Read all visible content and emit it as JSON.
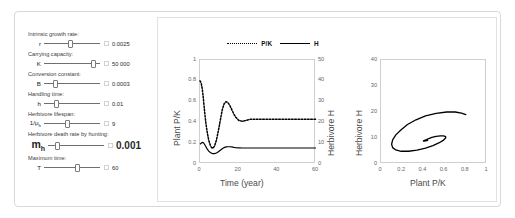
{
  "window": {
    "corner_icon": "settings-gear-icon"
  },
  "controls": {
    "rows": [
      {
        "caption": "Intrinsic growth rate:",
        "symbol": "r",
        "symbol_sub": "",
        "value": "0.0025",
        "knob_pct": 48,
        "emphasis": false
      },
      {
        "caption": "Carrying capacity:",
        "symbol": "K",
        "symbol_sub": "",
        "value": "50 000",
        "knob_pct": 92,
        "emphasis": false
      },
      {
        "caption": "Conversion constant:",
        "symbol": "B",
        "symbol_sub": "",
        "value": "0.0003",
        "knob_pct": 18,
        "emphasis": false
      },
      {
        "caption": "Handling time:",
        "symbol": "h",
        "symbol_sub": "",
        "value": "0.01",
        "knob_pct": 20,
        "emphasis": false
      },
      {
        "caption": "Herbivore lifespan:",
        "symbol": "1/μ",
        "symbol_sub": "h",
        "value": "9",
        "knob_pct": 42,
        "emphasis": false
      },
      {
        "caption": "Herbivore death rate by hunting:",
        "symbol": "m",
        "symbol_sub": "h",
        "value": "0.001",
        "knob_pct": 14,
        "emphasis": true
      },
      {
        "caption": "Maximum time:",
        "symbol": "T",
        "symbol_sub": "",
        "value": "60",
        "knob_pct": 60,
        "emphasis": false
      }
    ]
  },
  "legend": {
    "items": [
      {
        "label": "P/K",
        "style": "dotted"
      },
      {
        "label": "H",
        "style": "solid"
      }
    ]
  },
  "chart_data": [
    {
      "type": "line",
      "title": "",
      "xlabel": "Time (year)",
      "ylabel": "Plant P/K",
      "y2label": "Herbivore H",
      "xlim": [
        0,
        60
      ],
      "ylim": [
        0,
        1
      ],
      "y2lim": [
        0,
        50
      ],
      "xticks": [
        0,
        20,
        40,
        60
      ],
      "yticks": [
        0,
        0.2,
        0.4,
        0.6,
        0.8,
        1
      ],
      "y2ticks": [
        0,
        10,
        20,
        30,
        40,
        50
      ],
      "grid": false,
      "legend_position": "top",
      "series": [
        {
          "name": "P/K",
          "style": "dotted",
          "axis": "left",
          "x": [
            0,
            0.6,
            1.2,
            1.8,
            2.4,
            3.0,
            3.6,
            4.5,
            5.5,
            6.5,
            7.5,
            8.5,
            9.5,
            10.5,
            11.5,
            12.5,
            13.5,
            14.5,
            15.5,
            16.5,
            17.5,
            18.5,
            20,
            22,
            24,
            26,
            28,
            30,
            35,
            40,
            45,
            50,
            55,
            60
          ],
          "y": [
            0.8,
            0.78,
            0.72,
            0.62,
            0.5,
            0.4,
            0.32,
            0.23,
            0.17,
            0.15,
            0.17,
            0.23,
            0.32,
            0.42,
            0.52,
            0.58,
            0.6,
            0.59,
            0.56,
            0.52,
            0.48,
            0.45,
            0.42,
            0.41,
            0.42,
            0.43,
            0.43,
            0.43,
            0.43,
            0.43,
            0.43,
            0.43,
            0.43,
            0.43
          ]
        },
        {
          "name": "H",
          "style": "solid",
          "axis": "right",
          "x": [
            0,
            0.6,
            1.2,
            1.8,
            2.4,
            3.0,
            3.6,
            4.5,
            5.5,
            6.5,
            7.5,
            8.5,
            9.5,
            10.5,
            11.5,
            12.5,
            13.5,
            14.5,
            15.5,
            16.5,
            17.5,
            18.5,
            20,
            22,
            24,
            26,
            28,
            30,
            35,
            40,
            45,
            50,
            55,
            60
          ],
          "y": [
            9.5,
            10.0,
            10.4,
            10.2,
            9.4,
            8.4,
            7.4,
            6.2,
            5.4,
            5.0,
            5.0,
            5.3,
            5.9,
            6.6,
            7.3,
            7.9,
            8.2,
            8.3,
            8.3,
            8.2,
            8.0,
            7.9,
            7.8,
            7.7,
            7.7,
            7.7,
            7.7,
            7.7,
            7.7,
            7.7,
            7.7,
            7.7,
            7.7,
            7.7
          ]
        }
      ]
    },
    {
      "type": "line",
      "title": "",
      "xlabel": "Plant P/K",
      "ylabel": "Herbivore H",
      "xlim": [
        0,
        1
      ],
      "ylim": [
        0,
        40
      ],
      "xticks": [
        0,
        0.2,
        0.4,
        0.6,
        0.8,
        1
      ],
      "yticks": [
        0,
        10,
        20,
        30,
        40
      ],
      "grid": false,
      "series": [
        {
          "name": "phase-trajectory",
          "style": "solid",
          "x": [
            0.8,
            0.76,
            0.7,
            0.62,
            0.52,
            0.42,
            0.33,
            0.25,
            0.19,
            0.14,
            0.11,
            0.1,
            0.11,
            0.14,
            0.19,
            0.26,
            0.34,
            0.42,
            0.49,
            0.55,
            0.59,
            0.61,
            0.61,
            0.59,
            0.56,
            0.52,
            0.48,
            0.45,
            0.43,
            0.41,
            0.4,
            0.4,
            0.41,
            0.42,
            0.43,
            0.44,
            0.44,
            0.43,
            0.43,
            0.43
          ],
          "y": [
            19.0,
            19.6,
            20.0,
            20.0,
            19.5,
            18.5,
            17.0,
            15.2,
            13.2,
            11.2,
            9.3,
            7.6,
            6.3,
            5.4,
            4.9,
            4.9,
            5.3,
            6.1,
            7.1,
            8.2,
            9.2,
            10.0,
            10.5,
            10.8,
            10.8,
            10.6,
            10.2,
            9.8,
            9.4,
            9.1,
            8.9,
            8.8,
            8.8,
            8.9,
            9.0,
            9.1,
            9.2,
            9.2,
            9.2,
            9.2
          ]
        }
      ]
    }
  ]
}
